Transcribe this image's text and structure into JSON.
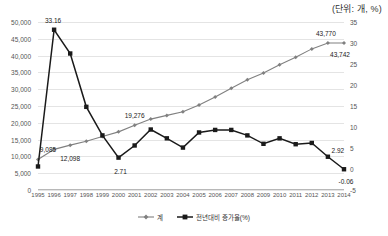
{
  "unit_note": "(단위: 개, %)",
  "legend": {
    "position": "bottom-center",
    "items": [
      {
        "label": "계",
        "marker": "diamond-marker-icon",
        "color": "#808080"
      },
      {
        "label": "전년대비 증가율(%)",
        "marker": "square-marker-icon",
        "color": "#1a1a1a"
      }
    ]
  },
  "axes": {
    "left": {
      "ticks": [
        "0",
        "5,000",
        "10,000",
        "15,000",
        "20,000",
        "25,000",
        "30,000",
        "35,000",
        "40,000",
        "45,000",
        "50,000"
      ],
      "min": 0,
      "max": 50000,
      "step": 5000
    },
    "right": {
      "ticks": [
        "-5",
        "0",
        "5",
        "10",
        "15",
        "20",
        "25",
        "30",
        "35"
      ],
      "min": -5,
      "max": 35,
      "step": 5
    },
    "x": {
      "ticks": [
        "1995",
        "1996",
        "1997",
        "1998",
        "1999",
        "2000",
        "2001",
        "2002",
        "2003",
        "2004",
        "2005",
        "2006",
        "2007",
        "2008",
        "2009",
        "2010",
        "2011",
        "2012",
        "2013",
        "2014"
      ]
    }
  },
  "annotations": [
    {
      "name": "peak-growth-label",
      "text": "33.16",
      "x": 1996,
      "axis": "right",
      "value": 33.16
    },
    {
      "name": "count-1995-label",
      "text": "9,085",
      "x": 1995,
      "axis": "left",
      "value": 9085
    },
    {
      "name": "count-1996-label",
      "text": "12,098",
      "x": 1996,
      "axis": "left",
      "value": 12098
    },
    {
      "name": "growth-2000-label",
      "text": "2.71",
      "x": 2000,
      "axis": "right",
      "value": 2.71
    },
    {
      "name": "count-2001-label",
      "text": "19,276",
      "x": 2001,
      "axis": "left",
      "value": 19276
    },
    {
      "name": "count-2013-label",
      "text": "43,770",
      "x": 2013,
      "axis": "left",
      "value": 43770
    },
    {
      "name": "count-2014-label",
      "text": "43,742",
      "x": 2014,
      "axis": "left",
      "value": 43742
    },
    {
      "name": "growth-2013-label",
      "text": "2.92",
      "x": 2013,
      "axis": "right",
      "value": 2.92
    },
    {
      "name": "growth-2014-label",
      "text": "-0.06",
      "x": 2014,
      "axis": "right",
      "value": -0.06
    }
  ],
  "chart_data": {
    "type": "line",
    "title": "",
    "subtitle": "",
    "xlabel": "",
    "ylabel": "",
    "unit_note": "(단위: 개, %)",
    "grid": true,
    "legend_position": "bottom-center",
    "x": [
      1995,
      1996,
      1997,
      1998,
      1999,
      2000,
      2001,
      2002,
      2003,
      2004,
      2005,
      2006,
      2007,
      2008,
      2009,
      2010,
      2011,
      2012,
      2013,
      2014
    ],
    "series": [
      {
        "name": "계",
        "axis": "left",
        "marker": "diamond",
        "color": "#808080",
        "ylim": [
          0,
          50000
        ],
        "values": [
          9085,
          12098,
          13350,
          14500,
          15900,
          17300,
          19276,
          21100,
          22200,
          23300,
          25300,
          27700,
          30300,
          32800,
          34800,
          37300,
          39500,
          42000,
          43770,
          43742
        ]
      },
      {
        "name": "전년대비 증가율(%)",
        "axis": "right",
        "marker": "square",
        "color": "#1a1a1a",
        "ylim": [
          -5,
          35
        ],
        "values": [
          0.6,
          33.16,
          27.5,
          14.8,
          8.0,
          2.71,
          5.6,
          9.4,
          7.3,
          5.1,
          8.7,
          9.3,
          9.3,
          8.0,
          6.0,
          7.3,
          5.9,
          6.2,
          2.92,
          -0.06
        ]
      }
    ]
  }
}
